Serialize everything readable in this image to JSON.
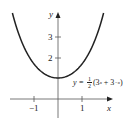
{
  "chart_data": {
    "type": "line",
    "title": "",
    "xlabel": "x",
    "ylabel": "y",
    "equation": "y = 1/2(3^x + 3^-x)",
    "xlim": [
      -2.4,
      2.5
    ],
    "ylim": [
      -0.9,
      4.0
    ],
    "x_ticks": [
      -1,
      1
    ],
    "x_tick_labels": [
      "−1",
      "1"
    ],
    "y_ticks": [
      2,
      3
    ],
    "y_tick_labels": [
      "2",
      "3"
    ],
    "grid": false,
    "legend": null,
    "series": [
      {
        "name": "y = 1/2(3^x + 3^-x)",
        "x": [
          -1.9,
          -1.5,
          -1.0,
          -0.5,
          0,
          0.5,
          1.0,
          1.5,
          1.9
        ],
        "values": [
          4.0,
          2.79,
          1.67,
          1.15,
          1.0,
          1.15,
          1.67,
          2.79,
          4.0
        ]
      }
    ]
  },
  "labels": {
    "y_axis": "y",
    "x_axis": "x",
    "tick_y3": "3",
    "tick_y2": "2",
    "tick_xm1": "−1",
    "tick_x1": "1",
    "eq_prefix": "y = ",
    "eq_num": "1",
    "eq_den": "2",
    "eq_body": "(3",
    "eq_exp1": "x",
    "eq_mid": " + 3",
    "eq_exp2": "−x",
    "eq_end": ")"
  }
}
